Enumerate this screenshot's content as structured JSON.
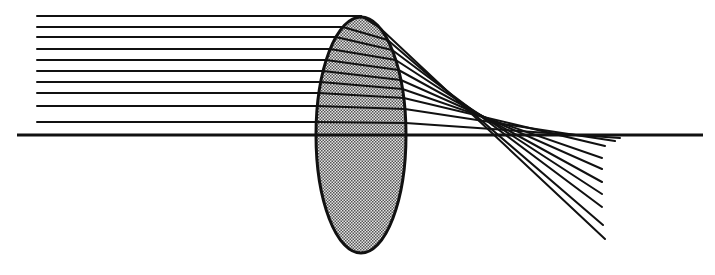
{
  "diagram": {
    "colors": {
      "ink": "#111111",
      "lens_fill": "#bdbdbd",
      "background": "#ffffff"
    },
    "optical_axis": {
      "x1": 17,
      "x2": 703,
      "y": 135
    },
    "lens": {
      "cx": 361,
      "cy": 135,
      "rx": 45,
      "ry": 118,
      "pattern": "stippled-gray"
    },
    "rays": [
      {
        "y_in": 16,
        "x_start": 37,
        "y_exit": 28,
        "end": [
          605,
          239
        ]
      },
      {
        "y_in": 27,
        "x_start": 37,
        "y_exit": 40,
        "end": [
          603,
          225
        ]
      },
      {
        "y_in": 37,
        "x_start": 37,
        "y_exit": 50,
        "end": [
          602,
          207
        ]
      },
      {
        "y_in": 49,
        "x_start": 37,
        "y_exit": 60,
        "end": [
          602,
          194
        ]
      },
      {
        "y_in": 60,
        "x_start": 37,
        "y_exit": 70,
        "end": [
          602,
          182
        ]
      },
      {
        "y_in": 71,
        "x_start": 37,
        "y_exit": 80,
        "end": [
          602,
          169
        ]
      },
      {
        "y_in": 82,
        "x_start": 37,
        "y_exit": 89,
        "end": [
          602,
          158
        ]
      },
      {
        "y_in": 93,
        "x_start": 37,
        "y_exit": 98,
        "end": [
          605,
          146
        ]
      },
      {
        "y_in": 106,
        "x_start": 37,
        "y_exit": 109,
        "end": [
          615,
          141
        ]
      },
      {
        "y_in": 122,
        "x_start": 37,
        "y_exit": 123,
        "end": [
          620,
          138
        ]
      }
    ]
  }
}
